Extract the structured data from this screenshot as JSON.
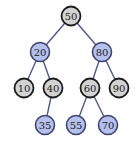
{
  "diagram": {
    "type": "binary-search-tree",
    "colors": {
      "highlight_fill": "#b6c0ec",
      "highlight_stroke": "#3d4470",
      "normal_fill": "#d3d3d3",
      "normal_stroke": "#1e1e1e",
      "edge": "#4b5a96"
    },
    "nodes": [
      {
        "id": "n50",
        "label": "50",
        "x": 71,
        "y": 16,
        "style": "gray"
      },
      {
        "id": "n20",
        "label": "20",
        "x": 40,
        "y": 52,
        "style": "blue"
      },
      {
        "id": "n80",
        "label": "80",
        "x": 102,
        "y": 52,
        "style": "blue"
      },
      {
        "id": "n10",
        "label": "10",
        "x": 24,
        "y": 88,
        "style": "gray"
      },
      {
        "id": "n40",
        "label": "40",
        "x": 53,
        "y": 88,
        "style": "gray"
      },
      {
        "id": "n60",
        "label": "60",
        "x": 90,
        "y": 88,
        "style": "gray"
      },
      {
        "id": "n90",
        "label": "90",
        "x": 119,
        "y": 88,
        "style": "gray"
      },
      {
        "id": "n35",
        "label": "35",
        "x": 45,
        "y": 125,
        "style": "blue"
      },
      {
        "id": "n55",
        "label": "55",
        "x": 76,
        "y": 125,
        "style": "blue"
      },
      {
        "id": "n70",
        "label": "70",
        "x": 108,
        "y": 125,
        "style": "blue"
      }
    ],
    "edges": [
      [
        "n50",
        "n20"
      ],
      [
        "n50",
        "n80"
      ],
      [
        "n20",
        "n10"
      ],
      [
        "n20",
        "n40"
      ],
      [
        "n80",
        "n60"
      ],
      [
        "n80",
        "n90"
      ],
      [
        "n40",
        "n35"
      ],
      [
        "n60",
        "n55"
      ],
      [
        "n60",
        "n70"
      ]
    ]
  }
}
